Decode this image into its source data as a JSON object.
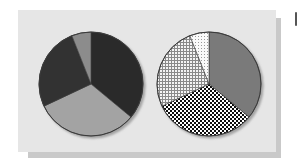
{
  "chart_data": [
    {
      "type": "pie",
      "title": "",
      "position": "left",
      "center": [
        91,
        84
      ],
      "radius": 52,
      "slices": [
        {
          "label": "",
          "value": 36,
          "fill": "#2b2b2b",
          "pattern": "solid"
        },
        {
          "label": "",
          "value": 32,
          "fill": "#a3a3a3",
          "pattern": "solid"
        },
        {
          "label": "",
          "value": 26,
          "fill": "#333333",
          "pattern": "solid"
        },
        {
          "label": "",
          "value": 6,
          "fill": "#8c8c8c",
          "pattern": "solid"
        }
      ],
      "legend": "none"
    },
    {
      "type": "pie",
      "title": "",
      "position": "right",
      "center": [
        209,
        84
      ],
      "radius": 52,
      "slices": [
        {
          "label": "",
          "value": 36,
          "fill": "#7a7a7a",
          "pattern": "solid"
        },
        {
          "label": "",
          "value": 32,
          "fill": "#000000",
          "pattern": "checker"
        },
        {
          "label": "",
          "value": 26,
          "fill": "#9a9a9a",
          "pattern": "grid"
        },
        {
          "label": "",
          "value": 6,
          "fill": "#bdbdbd",
          "pattern": "dots"
        }
      ],
      "legend": "none"
    }
  ],
  "colors": {
    "panel": "#e6e6e6",
    "shadow": "#c9c9c9",
    "outline": "#3a3a3a"
  }
}
